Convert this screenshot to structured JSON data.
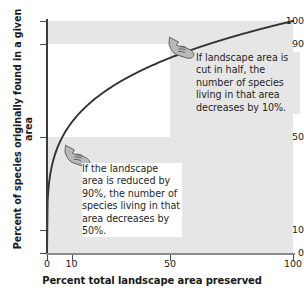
{
  "chart_data": {
    "type": "line",
    "title": "",
    "xlabel": "Percent total landscape area preserved",
    "ylabel": "Percent of species originally found in a given area",
    "xlim": [
      0,
      100
    ],
    "ylim": [
      0,
      100
    ],
    "xticks": [
      "0",
      "10",
      "50",
      "100"
    ],
    "xtick_values": [
      0,
      10,
      50,
      100
    ],
    "yticks": [
      "0",
      "10",
      "50",
      "90",
      "100"
    ],
    "ytick_values": [
      0,
      10,
      50,
      90,
      100
    ],
    "grid": false,
    "legend": "none",
    "series": [
      {
        "name": "species-area curve",
        "relation": "y = 100 * x^0.25",
        "x": [
          0,
          1,
          2,
          5,
          10,
          15,
          20,
          25,
          30,
          40,
          50,
          60,
          70,
          80,
          90,
          100
        ],
        "y": [
          0,
          31.6,
          37.6,
          47.3,
          56.2,
          62.2,
          66.9,
          70.7,
          74.0,
          79.5,
          84.1,
          88.0,
          91.5,
          94.6,
          97.4,
          100
        ]
      }
    ],
    "shaded_bands": [
      {
        "name": "upper-90-to-100",
        "y_from": 90,
        "y_to": 100,
        "x_from": 0,
        "x_to": 100,
        "color": "#e6e6e6"
      },
      {
        "name": "right-50-to-100",
        "x_from": 50,
        "x_to": 100,
        "y_from": 0,
        "y_to": 90,
        "color": "#e6e6e6"
      },
      {
        "name": "lower-left-0-to-50",
        "x_from": 0,
        "x_to": 50,
        "y_from": 0,
        "y_to": 50,
        "color": "#e6e6e6"
      }
    ],
    "annotations": [
      {
        "name": "cut-in-half",
        "text": "If landscape area is cut in half, the number of species living in that area decreases by 10%.",
        "icon": "pointing-hand-icon",
        "points_to_x": 50,
        "points_to_y": 90
      },
      {
        "name": "reduced-90",
        "text": "If the landscape area is reduced by 90%, the number of species living in that area decreases by 50%.",
        "icon": "pointing-hand-icon",
        "points_to_x": 10,
        "points_to_y": 50
      }
    ]
  },
  "axes": {
    "x_title": "Percent total landscape area preserved",
    "y_title": "Percent of species originally found in a given area",
    "y_labels": {
      "t100": "100",
      "t90": "90",
      "t50": "50",
      "t10": "10",
      "t0": "0"
    },
    "x_labels": {
      "t0": "0",
      "t10": "10",
      "t50": "50",
      "t100": "100"
    }
  },
  "callouts": {
    "cut_in_half": "If landscape area is cut in half, the number of species living in that area decreases by 10%.",
    "reduced_90": "If the landscape area is reduced by 90%, the number of species living in that area decreases by 50%."
  },
  "colors": {
    "band": "#e6e6e6",
    "curve": "#333333",
    "axis": "#3b3b3b",
    "text": "#1a1a1a"
  }
}
